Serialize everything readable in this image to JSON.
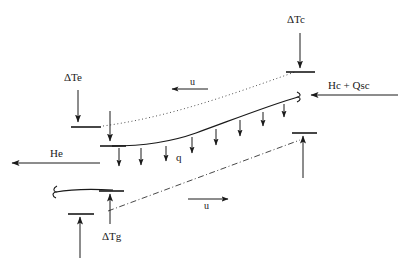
{
  "figure": {
    "type": "engineering-schematic",
    "background_color": "#ffffff",
    "line_color": "#1a1a1a",
    "width": 406,
    "height": 269
  },
  "labels": {
    "delta_tc": "ΔTc",
    "delta_te": "ΔTe",
    "delta_tg": "ΔTg",
    "hc_qsc": "Hc + Qsc",
    "he": "He",
    "q": "q",
    "u_upper": "u",
    "u_lower": "u"
  },
  "annotations": [
    {
      "name": "delta-tc",
      "text": "ΔTc",
      "x": 295,
      "y": 22,
      "arrow": "down"
    },
    {
      "name": "delta-te",
      "text": "ΔTe",
      "x": 78,
      "y": 78,
      "arrow": "down"
    },
    {
      "name": "delta-tg",
      "text": "ΔTg",
      "x": 103,
      "y": 238,
      "arrow": "up"
    },
    {
      "name": "hc-qsc",
      "text": "Hc + Qsc",
      "x": 342,
      "y": 88,
      "arrow": "left"
    },
    {
      "name": "he",
      "text": "He",
      "x": 55,
      "y": 155,
      "arrow": "left"
    },
    {
      "name": "q",
      "text": "q",
      "x": 177,
      "y": 158,
      "arrow": "down-series"
    },
    {
      "name": "u-upper",
      "text": "u",
      "x": 195,
      "y": 84,
      "arrow": "left"
    },
    {
      "name": "u-lower",
      "text": "u",
      "x": 205,
      "y": 206,
      "arrow": "right"
    }
  ],
  "curves": {
    "upper_dotted": {
      "style": "dotted",
      "from_x": 103,
      "from_y": 126,
      "to_x": 295,
      "to_y": 72
    },
    "main_solid": {
      "style": "solid",
      "from_x": 112,
      "from_y": 146,
      "to_x": 300,
      "to_y": 98
    },
    "lower_dashdot": {
      "style": "dash-dot",
      "from_x": 110,
      "from_y": 210,
      "to_x": 300,
      "to_y": 140
    },
    "bottom_short_solid": {
      "style": "solid",
      "from_x": 52,
      "from_y": 194,
      "to_x": 113,
      "to_y": 191
    }
  },
  "load_arrows": {
    "name": "q-distributed-load",
    "count": 8,
    "direction": "down"
  }
}
